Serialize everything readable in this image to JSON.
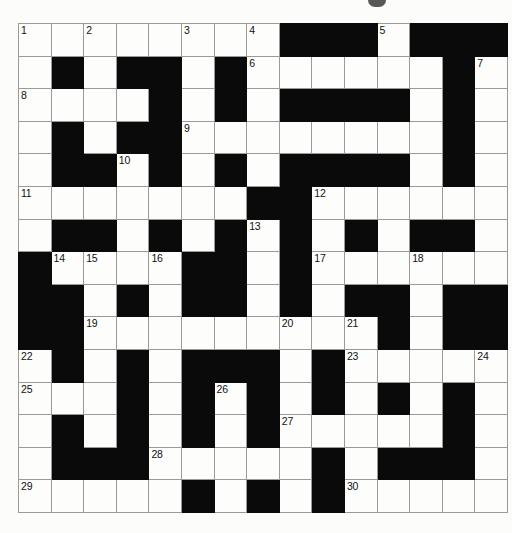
{
  "puzzle": {
    "kind": "crossword-grid",
    "title": "",
    "rows": 15,
    "columns": 15,
    "colors": {
      "block": "#0a0a0a",
      "cell": "#fdfdfc",
      "gridline": "#9a9a9a",
      "number": "#111111",
      "page_background": "#fcfcfb"
    },
    "legend": {
      "block_symbol": "#",
      "open_symbol": "."
    },
    "grid": [
      "........###.###",
      ".#.##.#.......#.",
      "....#.#.####.#.",
      ".#.##.........#.",
      ".##.#.#.####.#.",
      ".......##......",
      ".##.#.#.#.#.##.",
      "#....##.#......",
      "##.#.##.#.##.##",
      "##.........#.##",
      ".#.#.###.#.....",
      "...#.#.#.#.#.#.",
      ".#.#.#.#.......#",
      ".###......#.###.",
      ".....#.#.#....."
    ],
    "grid_rows": [
      {
        "row": 1,
        "cells": [
          "open",
          "open",
          "open",
          "open",
          "open",
          "open",
          "open",
          "open",
          "block",
          "block",
          "block",
          "open",
          "block",
          "block",
          "block"
        ]
      },
      {
        "row": 2,
        "cells": [
          "open",
          "block",
          "open",
          "block",
          "block",
          "open",
          "block",
          "open",
          "open",
          "open",
          "open",
          "open",
          "open",
          "block",
          "open"
        ]
      },
      {
        "row": 3,
        "cells": [
          "open",
          "open",
          "open",
          "open",
          "block",
          "open",
          "block",
          "open",
          "block",
          "block",
          "block",
          "block",
          "open",
          "block",
          "open"
        ]
      },
      {
        "row": 4,
        "cells": [
          "open",
          "block",
          "open",
          "block",
          "block",
          "open",
          "open",
          "open",
          "open",
          "open",
          "open",
          "open",
          "open",
          "block",
          "open"
        ]
      },
      {
        "row": 5,
        "cells": [
          "open",
          "block",
          "block",
          "open",
          "block",
          "open",
          "block",
          "open",
          "block",
          "block",
          "block",
          "block",
          "open",
          "block",
          "open"
        ]
      },
      {
        "row": 6,
        "cells": [
          "open",
          "open",
          "open",
          "open",
          "open",
          "open",
          "open",
          "block",
          "block",
          "open",
          "open",
          "open",
          "open",
          "open",
          "open"
        ]
      },
      {
        "row": 7,
        "cells": [
          "open",
          "block",
          "block",
          "open",
          "block",
          "open",
          "block",
          "open",
          "block",
          "open",
          "block",
          "open",
          "block",
          "block",
          "open"
        ]
      },
      {
        "row": 8,
        "cells": [
          "block",
          "open",
          "open",
          "open",
          "open",
          "block",
          "block",
          "open",
          "block",
          "open",
          "open",
          "open",
          "open",
          "open",
          "open"
        ]
      },
      {
        "row": 9,
        "cells": [
          "block",
          "block",
          "open",
          "block",
          "open",
          "block",
          "block",
          "open",
          "block",
          "open",
          "block",
          "block",
          "open",
          "block",
          "block"
        ]
      },
      {
        "row": 10,
        "cells": [
          "block",
          "block",
          "open",
          "open",
          "open",
          "open",
          "open",
          "open",
          "open",
          "open",
          "open",
          "block",
          "open",
          "block",
          "block"
        ]
      },
      {
        "row": 11,
        "cells": [
          "open",
          "block",
          "open",
          "block",
          "open",
          "block",
          "block",
          "block",
          "open",
          "block",
          "open",
          "open",
          "open",
          "open",
          "open"
        ]
      },
      {
        "row": 12,
        "cells": [
          "open",
          "open",
          "open",
          "block",
          "open",
          "block",
          "open",
          "block",
          "open",
          "block",
          "open",
          "block",
          "open",
          "block",
          "open"
        ]
      },
      {
        "row": 13,
        "cells": [
          "open",
          "block",
          "open",
          "block",
          "open",
          "block",
          "open",
          "block",
          "open",
          "open",
          "open",
          "open",
          "open",
          "block",
          "open"
        ]
      },
      {
        "row": 14,
        "cells": [
          "open",
          "block",
          "block",
          "block",
          "open",
          "open",
          "open",
          "open",
          "open",
          "block",
          "open",
          "block",
          "block",
          "block",
          "open"
        ]
      },
      {
        "row": 15,
        "cells": [
          "open",
          "open",
          "open",
          "open",
          "open",
          "block",
          "open",
          "block",
          "open",
          "block",
          "open",
          "open",
          "open",
          "open",
          "open"
        ]
      }
    ],
    "numbers": [
      {
        "label": "1",
        "row": 1,
        "col": 1
      },
      {
        "label": "2",
        "row": 1,
        "col": 3
      },
      {
        "label": "3",
        "row": 1,
        "col": 6
      },
      {
        "label": "4",
        "row": 1,
        "col": 8
      },
      {
        "label": "5",
        "row": 1,
        "col": 12
      },
      {
        "label": "6",
        "row": 2,
        "col": 8
      },
      {
        "label": "7",
        "row": 2,
        "col": 15
      },
      {
        "label": "8",
        "row": 3,
        "col": 1
      },
      {
        "label": "9",
        "row": 4,
        "col": 6
      },
      {
        "label": "10",
        "row": 5,
        "col": 4
      },
      {
        "label": "11",
        "row": 6,
        "col": 1
      },
      {
        "label": "12",
        "row": 6,
        "col": 10
      },
      {
        "label": "13",
        "row": 7,
        "col": 8
      },
      {
        "label": "14",
        "row": 8,
        "col": 2
      },
      {
        "label": "15",
        "row": 8,
        "col": 3
      },
      {
        "label": "16",
        "row": 8,
        "col": 5
      },
      {
        "label": "17",
        "row": 8,
        "col": 10
      },
      {
        "label": "18",
        "row": 8,
        "col": 13
      },
      {
        "label": "19",
        "row": 10,
        "col": 3
      },
      {
        "label": "20",
        "row": 10,
        "col": 9
      },
      {
        "label": "21",
        "row": 10,
        "col": 11
      },
      {
        "label": "22",
        "row": 11,
        "col": 1
      },
      {
        "label": "23",
        "row": 11,
        "col": 11
      },
      {
        "label": "24",
        "row": 11,
        "col": 15
      },
      {
        "label": "25",
        "row": 12,
        "col": 1
      },
      {
        "label": "26",
        "row": 12,
        "col": 7
      },
      {
        "label": "27",
        "row": 13,
        "col": 9
      },
      {
        "label": "28",
        "row": 14,
        "col": 5
      },
      {
        "label": "29",
        "row": 15,
        "col": 1
      },
      {
        "label": "30",
        "row": 15,
        "col": 11
      }
    ]
  }
}
